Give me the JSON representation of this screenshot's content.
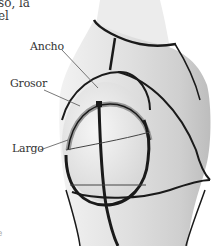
{
  "body_text": {
    "line1": "so, la",
    "line2": "el"
  },
  "figure": {
    "labels": {
      "width": "Ancho",
      "thickness": "Grosor",
      "length": "Largo"
    },
    "colors": {
      "background": "#ffffff",
      "fabric": "#d8d8d8",
      "fabric_light": "#ececec",
      "seam": "#1a1a1a",
      "leader": "#555555",
      "text": "#333333"
    }
  },
  "corner_mark": "e"
}
